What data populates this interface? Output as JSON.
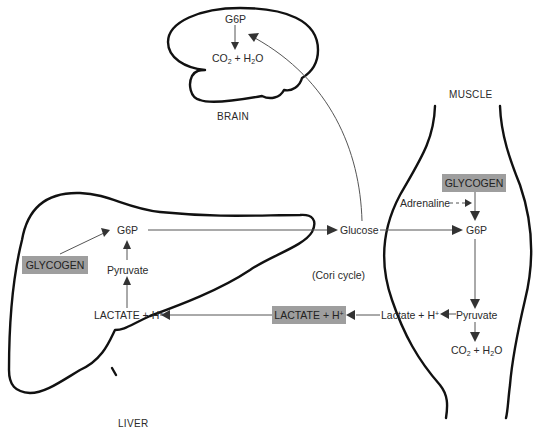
{
  "title": "Cori cycle",
  "colors": {
    "highlight_box": "#9e9e9e",
    "organ_outline": "#111111",
    "arrow": "#555555"
  },
  "organs": {
    "brain": "BRAIN",
    "liver": "LIVER",
    "muscle": "MUSCLE"
  },
  "brain": {
    "g6p": "G6P",
    "products": {
      "co": "CO",
      "co_sub": "2",
      "plus": " + H",
      "h_sub": "2",
      "o": "O"
    }
  },
  "liver": {
    "glycogen": "GLYCOGEN",
    "g6p": "G6P",
    "pyruvate": "Pyruvate",
    "lactate": {
      "text": "LACTATE + H",
      "sup": "+"
    }
  },
  "blood": {
    "glucose": "Glucose",
    "cycle_label": "(Cori cycle)",
    "lactate": {
      "text": "LACTATE + H",
      "sup": "+"
    }
  },
  "muscle": {
    "glycogen": "GLYCOGEN",
    "adrenaline": "Adrenaline",
    "g6p": "G6P",
    "pyruvate": "Pyruvate",
    "lactate": {
      "text": "Lactate + H",
      "sup": "+"
    },
    "products": {
      "co": "CO",
      "co_sub": "2",
      "plus": " + H",
      "h_sub": "2",
      "o": "O"
    }
  }
}
